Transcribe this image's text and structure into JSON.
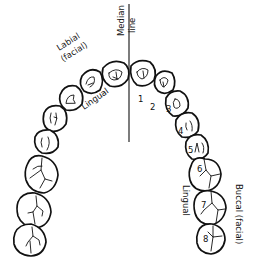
{
  "diagram": {
    "labels": {
      "median_line": [
        "Median",
        "line"
      ],
      "labial": [
        "Labial",
        "(facial)"
      ],
      "lingual_anterior": "Lingual",
      "lingual_posterior": "Lingual",
      "buccal": "Buccal (facial)"
    },
    "tooth_numbers": [
      "1",
      "2",
      "3",
      "4",
      "5",
      "6",
      "7",
      "8"
    ],
    "colors": {
      "line": "#111111",
      "background": "#ffffff"
    }
  }
}
